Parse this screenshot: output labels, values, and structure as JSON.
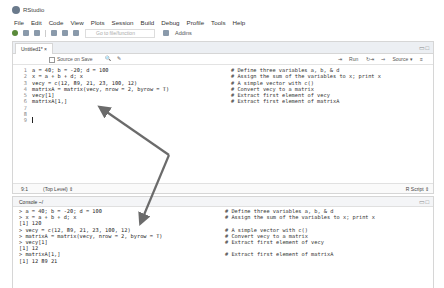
{
  "window": {
    "title": "RStudio"
  },
  "menu": [
    "File",
    "Edit",
    "Code",
    "View",
    "Plots",
    "Session",
    "Build",
    "Debug",
    "Profile",
    "Tools",
    "Help"
  ],
  "toolbar": {
    "goto_placeholder": "Go to file/function",
    "addins_label": "Addins"
  },
  "editor": {
    "tab_label": "Untitled1*",
    "source_on_save_label": "Source on Save",
    "run_label": "Run",
    "source_label": "Source",
    "lines": [
      {
        "num": "1",
        "code": "a = 40; b = -20; d = 100",
        "comment": "# Define three variables a, b, & d"
      },
      {
        "num": "2",
        "code": "x = a + b + d; x",
        "comment": "# Assign the sum of the variables to x; print x"
      },
      {
        "num": "3",
        "code": "vecy = c(12, 89, 21, 23, 100, 12)",
        "comment": "# A simple vector with c()"
      },
      {
        "num": "4",
        "code": "matrixA = matrix(vecy, nrow = 2, byrow = T)",
        "comment": "# Convert vecy to a matrix"
      },
      {
        "num": "5",
        "code": "vecy[1]",
        "comment": "# Extract first element of vecy"
      },
      {
        "num": "6",
        "code": "matrixA[1,]",
        "comment": "# Extract first element of matrixA"
      },
      {
        "num": "7",
        "code": "",
        "comment": ""
      },
      {
        "num": "8",
        "code": "",
        "comment": ""
      },
      {
        "num": "9",
        "code": "",
        "comment": ""
      }
    ],
    "status": {
      "position": "9:1",
      "scope": "(Top Level)",
      "file_type": "R Script"
    }
  },
  "console": {
    "title": "Console ~/",
    "lines": [
      {
        "text": "> a = 40; b = -20; d = 100",
        "comment": "# Define three variables a, b, & d"
      },
      {
        "text": "> x = a + b + d; x",
        "comment": "# Assign the sum of the variables to x; print x"
      },
      {
        "text": "[1] 120",
        "comment": ""
      },
      {
        "text": "> vecy = c(12, 89, 21, 23, 100, 12)",
        "comment": "# A simple vector with c()"
      },
      {
        "text": "> matrixA = matrix(vecy, nrow = 2, byrow = T)",
        "comment": "# Convert vecy to a matrix"
      },
      {
        "text": "> vecy[1]",
        "comment": "# Extract first element of vecy"
      },
      {
        "text": "[1] 12",
        "comment": ""
      },
      {
        "text": "> matrixA[1,]",
        "comment": "# Extract first element of matrixA"
      },
      {
        "text": "[1] 12 89 21",
        "comment": ""
      }
    ]
  },
  "colors": {
    "arrow": "#6b6b6b"
  }
}
